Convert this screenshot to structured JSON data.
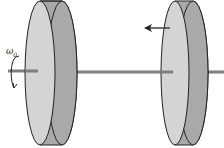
{
  "diagram": {
    "labels": {
      "omega_symbol": "ω",
      "omega_subscript": "0"
    },
    "colors": {
      "disk_face": "#d4d4d4",
      "disk_rim": "#a9a9a9",
      "shaft": "#7f7f7f",
      "outline": "#222222"
    }
  }
}
